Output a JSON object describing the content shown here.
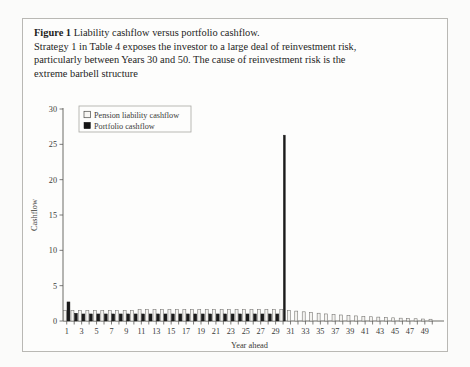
{
  "figure": {
    "label": "Figure 1",
    "title": "Liability cashflow versus portfolio cashflow.",
    "body_line1": "Strategy 1 in Table 4 exposes the investor to a large deal of reinvestment risk,",
    "body_line2": "particularly between Years 30 and 50. The cause of reinvestment risk is the",
    "body_line3": "extreme barbell structure"
  },
  "colors": {
    "liability": "#f4f3f0",
    "portfolio": "#1b1b1b",
    "axis": "#5c5b58",
    "frame": "#b9b8b4",
    "page": "#fbfbfa"
  },
  "legend": {
    "position": "top-left-inside",
    "items": [
      {
        "label": "Pension liability cashflow",
        "swatch": "hollow-square",
        "color": "#f4f3f0"
      },
      {
        "label": "Portfolio cashflow",
        "swatch": "filled-square",
        "color": "#1b1b1b"
      }
    ]
  },
  "chart_data": {
    "type": "bar",
    "title": "Liability cashflow versus portfolio cashflow",
    "xlabel": "Year ahead",
    "ylabel": "Cashflow",
    "grid": false,
    "ylim": [
      0,
      30
    ],
    "yticks": [
      0,
      5,
      10,
      15,
      20,
      25,
      30
    ],
    "ytick_labels": [
      "0",
      "5",
      "10",
      "15",
      "20",
      "25",
      "30"
    ],
    "xlim": [
      0.5,
      50.5
    ],
    "xticks": [
      1,
      2,
      3,
      4,
      5,
      6,
      7,
      8,
      9,
      10,
      11,
      12,
      13,
      14,
      15,
      16,
      17,
      18,
      19,
      20,
      21,
      22,
      23,
      24,
      25,
      26,
      27,
      28,
      29,
      30,
      31,
      32,
      33,
      34,
      35,
      36,
      37,
      38,
      39,
      40,
      41,
      42,
      43,
      44,
      45,
      46,
      47,
      48,
      49,
      50
    ],
    "xtick_labels_shown": [
      "1",
      "3",
      "5",
      "7",
      "9",
      "11",
      "13",
      "15",
      "17",
      "19",
      "21",
      "23",
      "25",
      "27",
      "29",
      "31",
      "33",
      "35",
      "37",
      "39",
      "41",
      "43",
      "45",
      "47",
      "49"
    ],
    "categories": [
      1,
      2,
      3,
      4,
      5,
      6,
      7,
      8,
      9,
      10,
      11,
      12,
      13,
      14,
      15,
      16,
      17,
      18,
      19,
      20,
      21,
      22,
      23,
      24,
      25,
      26,
      27,
      28,
      29,
      30,
      31,
      32,
      33,
      34,
      35,
      36,
      37,
      38,
      39,
      40,
      41,
      42,
      43,
      44,
      45,
      46,
      47,
      48,
      49,
      50
    ],
    "series": [
      {
        "name": "Pension liability cashflow",
        "color": "#f4f3f0",
        "values": [
          1.5,
          1.5,
          1.5,
          1.5,
          1.5,
          1.5,
          1.5,
          1.5,
          1.5,
          1.5,
          1.6,
          1.6,
          1.6,
          1.6,
          1.6,
          1.6,
          1.6,
          1.6,
          1.6,
          1.6,
          1.6,
          1.6,
          1.6,
          1.6,
          1.6,
          1.6,
          1.6,
          1.6,
          1.6,
          1.6,
          1.5,
          1.4,
          1.3,
          1.2,
          1.1,
          1.0,
          0.9,
          0.85,
          0.8,
          0.72,
          0.66,
          0.6,
          0.55,
          0.5,
          0.45,
          0.4,
          0.36,
          0.32,
          0.28,
          0.25
        ]
      },
      {
        "name": "Portfolio cashflow",
        "color": "#1b1b1b",
        "values": [
          2.7,
          1.1,
          1.0,
          1.0,
          1.0,
          1.0,
          1.0,
          1.0,
          1.0,
          1.0,
          1.0,
          1.0,
          1.0,
          1.0,
          1.0,
          1.0,
          1.0,
          1.0,
          1.0,
          1.0,
          1.0,
          1.0,
          1.0,
          1.0,
          1.0,
          1.0,
          1.0,
          1.0,
          1.0,
          26.3,
          0,
          0,
          0,
          0,
          0,
          0,
          0,
          0,
          0,
          0,
          0,
          0,
          0,
          0,
          0,
          0,
          0,
          0,
          0,
          0
        ]
      }
    ],
    "annotations": [
      {
        "text": "large portfolio cashflow spike at Year 30",
        "x": 30,
        "y": 26.3
      }
    ]
  }
}
